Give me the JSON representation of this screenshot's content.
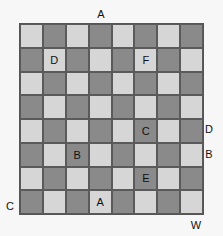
{
  "board": {
    "rows": 8,
    "cols": 8,
    "colors": {
      "light": "#d6d6d6",
      "dark": "#8a8a8a",
      "border": "#555555"
    },
    "cell_labels": [
      {
        "row": 1,
        "col": 1,
        "text": "D"
      },
      {
        "row": 1,
        "col": 5,
        "text": "F"
      },
      {
        "row": 4,
        "col": 5,
        "text": "C"
      },
      {
        "row": 5,
        "col": 2,
        "text": "B"
      },
      {
        "row": 6,
        "col": 5,
        "text": "E"
      },
      {
        "row": 7,
        "col": 3,
        "text": "A"
      }
    ]
  },
  "outer_labels": {
    "top": {
      "text": "A",
      "x": 101,
      "y": 14
    },
    "right_1": {
      "text": "D",
      "x": 209,
      "y": 129
    },
    "right_2": {
      "text": "B",
      "x": 209,
      "y": 154
    },
    "left": {
      "text": "C",
      "x": 10,
      "y": 206
    },
    "bottom": {
      "text": "W",
      "x": 196,
      "y": 225
    }
  }
}
